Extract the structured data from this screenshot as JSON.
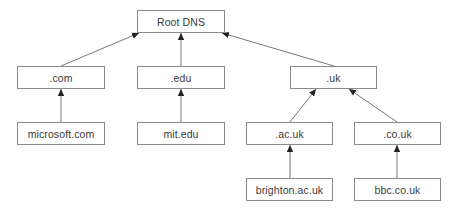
{
  "diagram": {
    "type": "tree",
    "colors": {
      "line": "#777777",
      "border": "#8a8a8a",
      "text": "#3a3a3a",
      "background": "#ffffff"
    },
    "nodes": [
      {
        "id": "root",
        "label": "Root DNS",
        "x": 137,
        "y": 10,
        "w": 88,
        "h": 23
      },
      {
        "id": "com",
        "label": ".com",
        "x": 17,
        "y": 66,
        "w": 88,
        "h": 23
      },
      {
        "id": "edu",
        "label": ".edu",
        "x": 137,
        "y": 66,
        "w": 88,
        "h": 23
      },
      {
        "id": "uk",
        "label": ".uk",
        "x": 290,
        "y": 66,
        "w": 87,
        "h": 23
      },
      {
        "id": "microsoft",
        "label": "microsoft.com",
        "x": 17,
        "y": 122,
        "w": 88,
        "h": 23
      },
      {
        "id": "mit",
        "label": "mit.edu",
        "x": 137,
        "y": 122,
        "w": 88,
        "h": 23
      },
      {
        "id": "acuk",
        "label": ".ac.uk",
        "x": 246,
        "y": 122,
        "w": 87,
        "h": 23
      },
      {
        "id": "couk",
        "label": ".co.uk",
        "x": 354,
        "y": 122,
        "w": 87,
        "h": 23
      },
      {
        "id": "brighton",
        "label": "brighton.ac.uk",
        "x": 246,
        "y": 178,
        "w": 87,
        "h": 23
      },
      {
        "id": "bbc",
        "label": "bbc.co.uk",
        "x": 354,
        "y": 178,
        "w": 87,
        "h": 23
      }
    ],
    "edges": [
      {
        "from": "com",
        "to": "root",
        "x1": 61,
        "y1": 66,
        "x2": 139,
        "y2": 33
      },
      {
        "from": "edu",
        "to": "root",
        "x1": 181,
        "y1": 66,
        "x2": 181,
        "y2": 33
      },
      {
        "from": "uk",
        "to": "root",
        "x1": 334,
        "y1": 66,
        "x2": 222,
        "y2": 33
      },
      {
        "from": "microsoft",
        "to": "com",
        "x1": 61,
        "y1": 122,
        "x2": 61,
        "y2": 89
      },
      {
        "from": "mit",
        "to": "edu",
        "x1": 181,
        "y1": 122,
        "x2": 181,
        "y2": 89
      },
      {
        "from": "acuk",
        "to": "uk",
        "x1": 290,
        "y1": 122,
        "x2": 316,
        "y2": 89
      },
      {
        "from": "couk",
        "to": "uk",
        "x1": 397,
        "y1": 122,
        "x2": 349,
        "y2": 89
      },
      {
        "from": "brighton",
        "to": "acuk",
        "x1": 290,
        "y1": 178,
        "x2": 290,
        "y2": 145
      },
      {
        "from": "bbc",
        "to": "couk",
        "x1": 397,
        "y1": 178,
        "x2": 397,
        "y2": 145
      }
    ]
  }
}
